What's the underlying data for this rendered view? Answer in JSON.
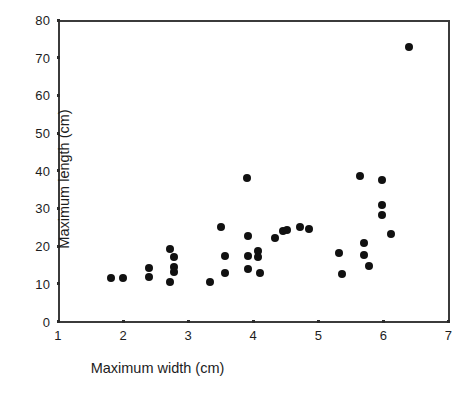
{
  "chart_data": {
    "type": "scatter",
    "title": "",
    "xlabel": "Maximum width (cm)",
    "ylabel": "Maximum length (cm)",
    "xlim": [
      1,
      7
    ],
    "ylim": [
      0,
      80
    ],
    "xticks": [
      1,
      2,
      3,
      4,
      5,
      6,
      7
    ],
    "yticks": [
      0,
      10,
      20,
      30,
      40,
      50,
      60,
      70,
      80
    ],
    "grid": false,
    "legend": null,
    "marker": "filled-circle",
    "marker_color": "#111111",
    "points": [
      {
        "x": 1.82,
        "y": 11.5
      },
      {
        "x": 2.0,
        "y": 11.5
      },
      {
        "x": 2.4,
        "y": 14.2
      },
      {
        "x": 2.4,
        "y": 11.8
      },
      {
        "x": 2.72,
        "y": 19.3
      },
      {
        "x": 2.78,
        "y": 17.0
      },
      {
        "x": 2.78,
        "y": 14.4
      },
      {
        "x": 2.78,
        "y": 13.2
      },
      {
        "x": 2.72,
        "y": 10.6
      },
      {
        "x": 3.34,
        "y": 10.5
      },
      {
        "x": 3.5,
        "y": 25.0
      },
      {
        "x": 3.56,
        "y": 17.3
      },
      {
        "x": 3.56,
        "y": 12.8
      },
      {
        "x": 3.9,
        "y": 38.0
      },
      {
        "x": 3.92,
        "y": 22.8
      },
      {
        "x": 3.92,
        "y": 17.5
      },
      {
        "x": 3.92,
        "y": 13.8
      },
      {
        "x": 4.08,
        "y": 18.8
      },
      {
        "x": 4.08,
        "y": 17.2
      },
      {
        "x": 4.1,
        "y": 13.0
      },
      {
        "x": 4.34,
        "y": 22.2
      },
      {
        "x": 4.46,
        "y": 24.0
      },
      {
        "x": 4.52,
        "y": 24.2
      },
      {
        "x": 4.72,
        "y": 25.2
      },
      {
        "x": 4.86,
        "y": 24.6
      },
      {
        "x": 5.32,
        "y": 18.3
      },
      {
        "x": 5.36,
        "y": 12.6
      },
      {
        "x": 5.64,
        "y": 38.5
      },
      {
        "x": 5.7,
        "y": 20.8
      },
      {
        "x": 5.7,
        "y": 17.6
      },
      {
        "x": 5.78,
        "y": 14.6
      },
      {
        "x": 5.98,
        "y": 37.5
      },
      {
        "x": 5.98,
        "y": 31.0
      },
      {
        "x": 5.98,
        "y": 28.2
      },
      {
        "x": 6.12,
        "y": 23.2
      },
      {
        "x": 6.4,
        "y": 72.8
      }
    ]
  }
}
